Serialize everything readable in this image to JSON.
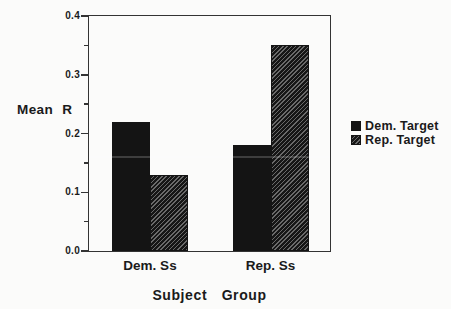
{
  "chart_data": {
    "type": "bar",
    "categories": [
      "Dem. Ss",
      "Rep. Ss"
    ],
    "series": [
      {
        "name": "Dem. Target",
        "pattern": "solid",
        "values": [
          0.22,
          0.18
        ]
      },
      {
        "name": "Rep. Target",
        "pattern": "hatch",
        "values": [
          0.13,
          0.35
        ]
      }
    ],
    "xlabel": "Subject Group",
    "ylabel": "Mean R",
    "ylim": [
      0.0,
      0.4
    ],
    "yticks": [
      0.0,
      0.1,
      0.2,
      0.3,
      0.4
    ],
    "ytick_minor_step": 0.05,
    "ytick_decimals": 1,
    "legend_position": "right",
    "grid": false
  },
  "colors": {
    "background": "#fbfbfa",
    "bar-solid": "#141414",
    "hatch-base": "#161616",
    "hatch-line": "#6a6a6a",
    "axis": "#333333",
    "text": "#1a1a1a"
  }
}
